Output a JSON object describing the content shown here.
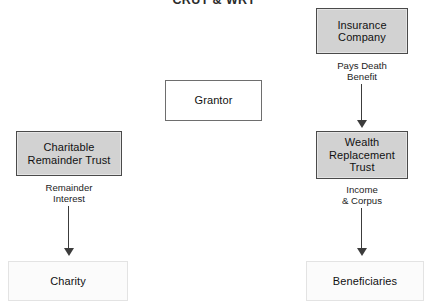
{
  "title": "CRUT & WRT",
  "canvas": {
    "width": 428,
    "height": 308,
    "background": "#ffffff"
  },
  "colors": {
    "shaded_fill": "#d2d2d2",
    "shaded_border": "#4a4a4a",
    "outline_border": "#6e6e6e",
    "faint_fill": "#fbfbfb",
    "faint_border": "#e3e3e3",
    "connector": "#3c3c3c",
    "text": "#111111"
  },
  "nodes": {
    "insurance_company": {
      "label": "Insurance\nCompany",
      "style": "shaded"
    },
    "grantor": {
      "label": "Grantor",
      "style": "outlined"
    },
    "charitable_remainder_trust": {
      "label": "Charitable\nRemainder Trust",
      "style": "shaded"
    },
    "wealth_replacement_trust": {
      "label": "Wealth\nReplacement\nTrust",
      "style": "shaded"
    },
    "charity": {
      "label": "Charity",
      "style": "faint"
    },
    "beneficiaries": {
      "label": "Beneficiaries",
      "style": "faint"
    }
  },
  "connectors": {
    "pays_death_benefit": {
      "label": "Pays Death\nBenefit",
      "from": "insurance_company",
      "to": "wealth_replacement_trust",
      "direction": "down"
    },
    "income_and_corpus": {
      "label": "Income\n& Corpus",
      "from": "wealth_replacement_trust",
      "to": "beneficiaries",
      "direction": "down"
    },
    "remainder_interest": {
      "label": "Remainder\nInterest",
      "from": "charitable_remainder_trust",
      "to": "charity",
      "direction": "down"
    }
  }
}
